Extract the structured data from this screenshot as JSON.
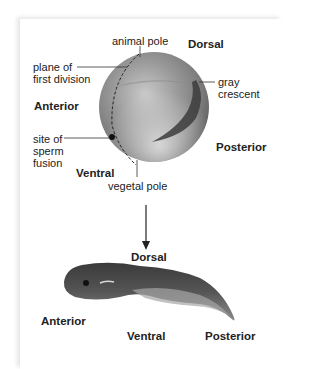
{
  "figure": {
    "egg": {
      "labels": {
        "animal_pole": "animal pole",
        "plane_first_division_line1": "plane of",
        "plane_first_division_line2": "first division",
        "gray_crescent_line1": "gray",
        "gray_crescent_line2": "crescent",
        "sperm_fusion_line1": "site of",
        "sperm_fusion_line2": "sperm",
        "sperm_fusion_line3": "fusion",
        "vegetal_pole": "vegetal pole"
      },
      "axes": {
        "dorsal": "Dorsal",
        "anterior": "Anterior",
        "posterior": "Posterior",
        "ventral": "Ventral"
      }
    },
    "tadpole": {
      "axes": {
        "dorsal": "Dorsal",
        "anterior": "Anterior",
        "ventral": "Ventral",
        "posterior": "Posterior"
      }
    },
    "colors": {
      "background": "#ffffff",
      "sphere_light": "#d9d9d9",
      "sphere_dark": "#6e6e6e",
      "gray_crescent": "#3c3c3c",
      "leader_lines": "#333333"
    }
  }
}
